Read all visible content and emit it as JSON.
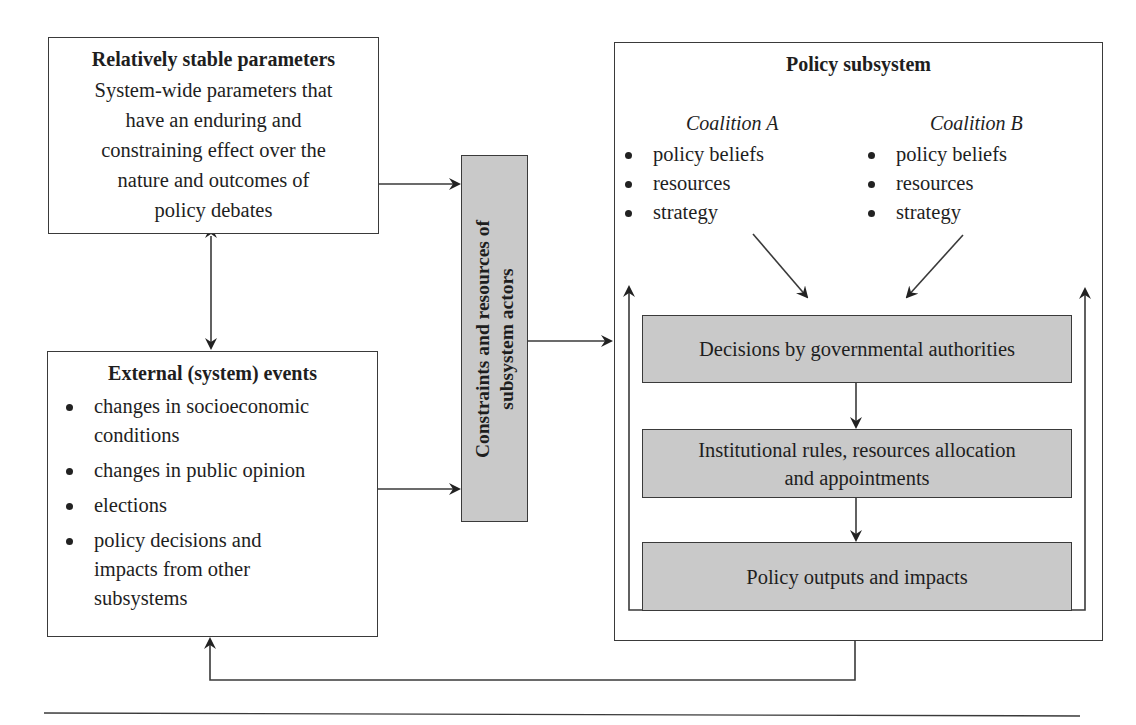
{
  "stable_parameters": {
    "title": "Relatively stable parameters",
    "lines": [
      "System-wide parameters that",
      "have an enduring and",
      "constraining effect over the",
      "nature and outcomes of",
      "policy debates"
    ]
  },
  "external_events": {
    "title": "External (system) events",
    "items": [
      [
        "changes in socioeconomic",
        "conditions"
      ],
      [
        "changes in public opinion"
      ],
      [
        "elections"
      ],
      [
        "policy decisions and",
        "impacts from other",
        "subsystems"
      ]
    ]
  },
  "constraints": {
    "line1": "Constraints and resources of",
    "line2": "subsystem actors"
  },
  "policy_subsystem": {
    "title": "Policy subsystem",
    "coalitions": [
      {
        "name": "Coalition A",
        "items": [
          "policy beliefs",
          "resources",
          "strategy"
        ]
      },
      {
        "name": "Coalition B",
        "items": [
          "policy beliefs",
          "resources",
          "strategy"
        ]
      }
    ],
    "steps": [
      {
        "lines": [
          "Decisions by governmental authorities"
        ]
      },
      {
        "lines": [
          "Institutional rules, resources allocation",
          "and appointments"
        ]
      },
      {
        "lines": [
          "Policy outputs and impacts"
        ]
      }
    ]
  },
  "colors": {
    "grey_fill": "#c9c9c9",
    "line": "#3a3a3a"
  }
}
